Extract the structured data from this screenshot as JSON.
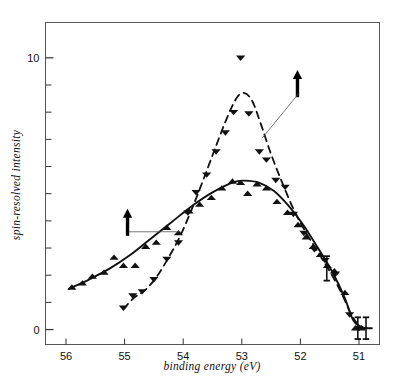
{
  "figure": {
    "name": "spin-resolved-photoemission-spectrum",
    "background_color": "#ffffff",
    "ink_color": "#111111"
  },
  "chart_data": {
    "type": "scatter",
    "title": "",
    "subtitle": "",
    "xlabel": "binding energy  (eV)",
    "ylabel": "spin-resolved intensity",
    "xlim": [
      56.35,
      50.65
    ],
    "ylim": [
      -0.55,
      11.3
    ],
    "x_axis_inverted": true,
    "grid": false,
    "legend": "none",
    "x_ticks_major": [
      56,
      55,
      54,
      53,
      52,
      51
    ],
    "x_tick_labels": [
      "56",
      "55",
      "54",
      "53",
      "52",
      "51"
    ],
    "y_ticks_major": [
      0,
      10
    ],
    "y_tick_labels": [
      "0",
      "10"
    ],
    "y_ticks_minor": [
      1,
      2,
      3,
      4,
      5,
      6,
      7,
      8,
      9
    ],
    "series": [
      {
        "name": "spin-up",
        "marker": "triangle-up",
        "line_style": "solid",
        "annotation_symbol": "up-arrow",
        "points": [
          {
            "x": 55.9,
            "y": 1.55
          },
          {
            "x": 55.72,
            "y": 1.7
          },
          {
            "x": 55.55,
            "y": 1.95
          },
          {
            "x": 55.35,
            "y": 2.1
          },
          {
            "x": 55.18,
            "y": 2.65
          },
          {
            "x": 55.02,
            "y": 2.35
          },
          {
            "x": 54.82,
            "y": 2.35
          },
          {
            "x": 54.64,
            "y": 3.05
          },
          {
            "x": 54.46,
            "y": 3.2
          },
          {
            "x": 54.28,
            "y": 3.75
          },
          {
            "x": 54.08,
            "y": 3.55
          },
          {
            "x": 53.9,
            "y": 4.35
          },
          {
            "x": 53.72,
            "y": 4.6
          },
          {
            "x": 53.52,
            "y": 4.85
          },
          {
            "x": 53.34,
            "y": 5.2
          },
          {
            "x": 53.16,
            "y": 5.45
          },
          {
            "x": 53.02,
            "y": 5.4
          },
          {
            "x": 52.9,
            "y": 5.0
          },
          {
            "x": 52.74,
            "y": 5.35
          },
          {
            "x": 52.58,
            "y": 5.2
          },
          {
            "x": 52.4,
            "y": 4.7
          },
          {
            "x": 52.22,
            "y": 4.3
          },
          {
            "x": 52.04,
            "y": 3.85
          },
          {
            "x": 51.9,
            "y": 3.4
          },
          {
            "x": 51.78,
            "y": 3.05
          },
          {
            "x": 51.66,
            "y": 2.75
          },
          {
            "x": 51.54,
            "y": 2.35
          },
          {
            "x": 51.42,
            "y": 2.15
          },
          {
            "x": 51.24,
            "y": 1.35
          },
          {
            "x": 51.06,
            "y": 0.05
          },
          {
            "x": 50.96,
            "y": 0.05
          }
        ],
        "curve": [
          {
            "x": 55.95,
            "y": 1.5
          },
          {
            "x": 55.6,
            "y": 1.85
          },
          {
            "x": 55.25,
            "y": 2.25
          },
          {
            "x": 54.9,
            "y": 2.75
          },
          {
            "x": 54.55,
            "y": 3.35
          },
          {
            "x": 54.2,
            "y": 3.95
          },
          {
            "x": 53.85,
            "y": 4.55
          },
          {
            "x": 53.5,
            "y": 5.05
          },
          {
            "x": 53.15,
            "y": 5.42
          },
          {
            "x": 52.95,
            "y": 5.48
          },
          {
            "x": 52.7,
            "y": 5.4
          },
          {
            "x": 52.45,
            "y": 5.1
          },
          {
            "x": 52.2,
            "y": 4.55
          },
          {
            "x": 51.95,
            "y": 3.85
          },
          {
            "x": 51.7,
            "y": 3.0
          },
          {
            "x": 51.45,
            "y": 2.1
          },
          {
            "x": 51.25,
            "y": 1.2
          },
          {
            "x": 51.1,
            "y": 0.35
          },
          {
            "x": 50.95,
            "y": 0.08
          },
          {
            "x": 50.78,
            "y": 0.05
          }
        ]
      },
      {
        "name": "spin-down",
        "marker": "triangle-down",
        "line_style": "dashed",
        "annotation_symbol": "down-arrow",
        "points": [
          {
            "x": 55.02,
            "y": 0.8
          },
          {
            "x": 54.86,
            "y": 1.25
          },
          {
            "x": 54.7,
            "y": 1.4
          },
          {
            "x": 54.5,
            "y": 1.85
          },
          {
            "x": 54.28,
            "y": 2.6
          },
          {
            "x": 54.08,
            "y": 3.2
          },
          {
            "x": 53.92,
            "y": 4.3
          },
          {
            "x": 53.78,
            "y": 5.05
          },
          {
            "x": 53.6,
            "y": 5.7
          },
          {
            "x": 53.44,
            "y": 6.55
          },
          {
            "x": 53.28,
            "y": 7.25
          },
          {
            "x": 53.14,
            "y": 8.0
          },
          {
            "x": 53.02,
            "y": 10.0
          },
          {
            "x": 52.88,
            "y": 7.95
          },
          {
            "x": 52.7,
            "y": 6.55
          },
          {
            "x": 52.58,
            "y": 6.25
          },
          {
            "x": 52.42,
            "y": 5.5
          },
          {
            "x": 52.26,
            "y": 5.25
          },
          {
            "x": 52.12,
            "y": 4.25
          },
          {
            "x": 51.94,
            "y": 3.55
          },
          {
            "x": 51.76,
            "y": 2.95
          },
          {
            "x": 51.58,
            "y": 2.55
          },
          {
            "x": 51.4,
            "y": 2.05
          },
          {
            "x": 51.16,
            "y": 0.55
          },
          {
            "x": 51.0,
            "y": 0.05
          }
        ],
        "curve": [
          {
            "x": 55.02,
            "y": 0.75
          },
          {
            "x": 54.85,
            "y": 1.15
          },
          {
            "x": 54.65,
            "y": 1.45
          },
          {
            "x": 54.45,
            "y": 1.95
          },
          {
            "x": 54.25,
            "y": 2.65
          },
          {
            "x": 54.05,
            "y": 3.45
          },
          {
            "x": 53.85,
            "y": 4.45
          },
          {
            "x": 53.65,
            "y": 5.55
          },
          {
            "x": 53.45,
            "y": 6.7
          },
          {
            "x": 53.25,
            "y": 7.8
          },
          {
            "x": 53.08,
            "y": 8.55
          },
          {
            "x": 52.95,
            "y": 8.7
          },
          {
            "x": 52.82,
            "y": 8.4
          },
          {
            "x": 52.68,
            "y": 7.6
          },
          {
            "x": 52.5,
            "y": 6.45
          },
          {
            "x": 52.3,
            "y": 5.35
          },
          {
            "x": 52.1,
            "y": 4.35
          },
          {
            "x": 51.9,
            "y": 3.55
          },
          {
            "x": 51.7,
            "y": 2.85
          },
          {
            "x": 51.5,
            "y": 2.15
          },
          {
            "x": 51.3,
            "y": 1.35
          },
          {
            "x": 51.12,
            "y": 0.5
          },
          {
            "x": 50.98,
            "y": 0.1
          }
        ]
      }
    ],
    "error_bars": [
      {
        "x": 51.55,
        "y": 2.25,
        "err": 0.45
      },
      {
        "x": 51.02,
        "y": 0.05,
        "err": 0.4
      },
      {
        "x": 50.88,
        "y": 0.05,
        "err": 0.4
      }
    ],
    "annotations": [
      {
        "label": "spin-up-arrow",
        "symbol": "↑",
        "arrow_x": 54.95,
        "arrow_y_top": 4.45,
        "arrow_y_bottom": 3.45,
        "leader_to_x": 54.05,
        "leader_to_y": 3.6
      },
      {
        "label": "spin-down-arrow",
        "symbol": "↓",
        "arrow_x": 52.05,
        "arrow_y_top": 9.55,
        "arrow_y_bottom": 8.55,
        "leader_to_x": 52.65,
        "leader_to_y": 7.05
      }
    ]
  }
}
